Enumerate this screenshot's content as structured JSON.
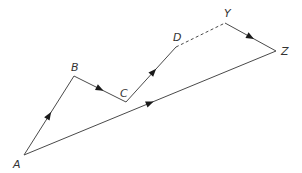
{
  "diagram": {
    "type": "vector path diagram",
    "line_color": "#4a4a4a",
    "arrow_color": "#1a1a1a",
    "points": {
      "A": {
        "label": "A",
        "x": 24,
        "y": 155,
        "lx": 13,
        "ly": 168
      },
      "B": {
        "label": "B",
        "x": 74,
        "y": 76,
        "lx": 71,
        "ly": 71
      },
      "C": {
        "label": "C",
        "x": 126,
        "y": 102,
        "lx": 120,
        "ly": 97
      },
      "D": {
        "label": "D",
        "x": 176,
        "y": 47,
        "lx": 173,
        "ly": 41
      },
      "Y": {
        "label": "Y",
        "x": 225,
        "y": 23,
        "lx": 224,
        "ly": 17
      },
      "Z": {
        "label": "Z",
        "x": 276,
        "y": 51,
        "lx": 281,
        "ly": 55
      }
    },
    "segments": [
      {
        "from": "A",
        "to": "B",
        "style": "solid",
        "arrow": true
      },
      {
        "from": "B",
        "to": "C",
        "style": "solid",
        "arrow": true
      },
      {
        "from": "C",
        "to": "D",
        "style": "solid",
        "arrow": true
      },
      {
        "from": "D",
        "to": "Y",
        "style": "dashed",
        "arrow": false
      },
      {
        "from": "Y",
        "to": "Z",
        "style": "solid",
        "arrow": true
      },
      {
        "from": "A",
        "to": "Z",
        "style": "solid",
        "arrow": true
      }
    ]
  }
}
